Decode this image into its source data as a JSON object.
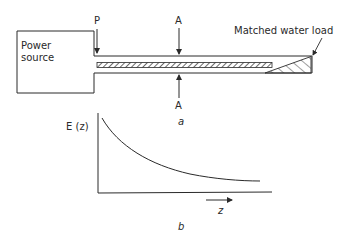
{
  "figure": {
    "part_a": {
      "caption": "a",
      "power_source_label_line1": "Power",
      "power_source_label_line2": "source",
      "port_label": "P",
      "section_label_top": "A",
      "section_label_bottom": "A",
      "load_label": "Matched water load"
    },
    "part_b": {
      "caption": "b",
      "y_axis_label": "E (z)",
      "x_axis_label": "z"
    },
    "colors": {
      "ink": "#2a2a2a",
      "background": "#ffffff"
    }
  }
}
